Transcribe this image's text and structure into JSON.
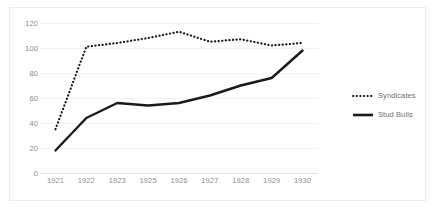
{
  "chart_data": {
    "type": "line",
    "title": "",
    "xlabel": "",
    "ylabel": "",
    "categories": [
      "1921",
      "1922",
      "1923",
      "1925",
      "1926",
      "1927",
      "1928",
      "1929",
      "1930"
    ],
    "ylim": [
      0,
      120
    ],
    "yticks": [
      0,
      20,
      40,
      60,
      80,
      100,
      120
    ],
    "ytick_labels": [
      "0",
      "20",
      "40",
      "60",
      "80",
      "100",
      "120"
    ],
    "grid": true,
    "legend_position": "right",
    "series": [
      {
        "name": "Syndicates",
        "style": "dotted",
        "color": "#1a1a1a",
        "values": [
          35,
          101,
          104,
          108,
          113,
          105,
          107,
          102,
          104
        ]
      },
      {
        "name": "Stud Bulls",
        "style": "solid",
        "color": "#1a1a1a",
        "values": [
          18,
          44,
          56,
          54,
          56,
          62,
          70,
          76,
          98
        ]
      }
    ]
  },
  "legend": {
    "entries": [
      {
        "label": "Syndicates"
      },
      {
        "label": "Stud Bulls"
      }
    ]
  }
}
